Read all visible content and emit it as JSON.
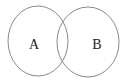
{
  "diagram": {
    "type": "venn",
    "stroke_color": "#8a8a8a",
    "label_color": "#222222",
    "background": "#ffffff",
    "sets": [
      {
        "label": "A",
        "cx": 38,
        "cy": 41,
        "rx": 30,
        "ry": 35,
        "label_x": 34,
        "label_y": 49
      },
      {
        "label": "B",
        "cx": 88,
        "cy": 42,
        "rx": 31,
        "ry": 35,
        "label_x": 97,
        "label_y": 49
      }
    ]
  }
}
